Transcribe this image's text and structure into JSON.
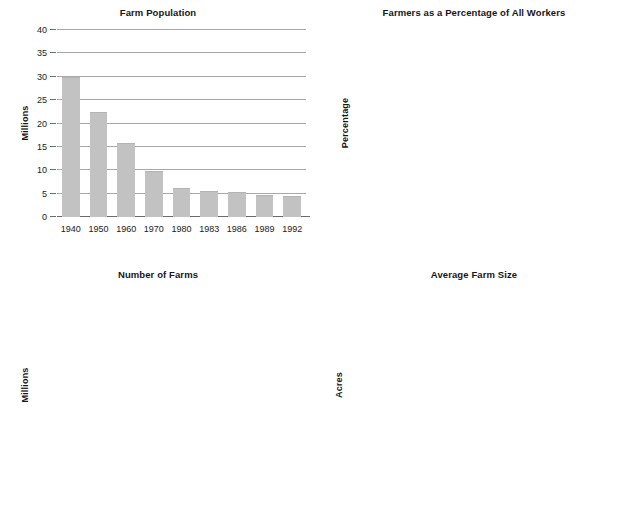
{
  "page": {
    "background": "#ffffff",
    "bar_color": "#c2c2c2",
    "grid_color": "#a8a8a8",
    "axis_color": "#6b6b6b",
    "text_color": "#1a1a1a"
  },
  "chart_data": [
    {
      "type": "bar",
      "title": "Farm Population",
      "xlabel": "",
      "ylabel": "Millions",
      "categories": [
        "1940",
        "1950",
        "1960",
        "1970",
        "1980",
        "1983",
        "1986",
        "1989",
        "1992"
      ],
      "values": [
        30.0,
        22.4,
        15.9,
        9.9,
        6.2,
        5.6,
        5.4,
        4.8,
        4.6
      ],
      "ylim": [
        0,
        40
      ],
      "yticks": [
        0,
        5,
        10,
        15,
        20,
        25,
        30,
        35,
        40
      ],
      "ytick_labels": [
        "0",
        "5",
        "10",
        "15",
        "20",
        "25",
        "30",
        "35",
        "40"
      ],
      "grid": true,
      "legend": "none"
    },
    {
      "type": "bar",
      "title": "Farmers as a Percentage of All Workers",
      "xlabel": "",
      "ylabel": "Percentage",
      "categories": [
        "1940",
        "1950",
        "1960",
        "1970",
        "1980",
        "1990",
        "1992"
      ],
      "values": [
        17.4,
        11.2,
        6.5,
        3.8,
        2.7,
        2.4,
        2.5
      ],
      "ylim": [
        0,
        20
      ],
      "yticks": [
        0,
        4,
        8,
        12,
        16,
        20
      ],
      "ytick_labels": [
        "0",
        "4",
        "8",
        "12",
        "16",
        "20"
      ],
      "grid": true,
      "legend": "none"
    },
    {
      "type": "bar",
      "title": "Number of Farms",
      "xlabel": "",
      "ylabel": "Millions",
      "categories": [
        "1940",
        "1950",
        "1960",
        "1970",
        "1980",
        "1983",
        "1986",
        "1989",
        "1993"
      ],
      "values": [
        6.0,
        5.25,
        3.95,
        2.9,
        2.35,
        2.25,
        2.15,
        2.05,
        2.05
      ],
      "ylim": [
        0,
        7
      ],
      "yticks": [
        0,
        1,
        2,
        3,
        4,
        5,
        6,
        7
      ],
      "ytick_labels": [
        "0",
        "1",
        "2",
        "3",
        "4",
        "5",
        "6",
        "7"
      ],
      "grid": true,
      "legend": "none"
    },
    {
      "type": "bar",
      "title": "Average Farm Size",
      "xlabel": "",
      "ylabel": "Acres",
      "categories": [
        "1940",
        "1950",
        "1960",
        "1970",
        "1980",
        "1983",
        "1986",
        "1989",
        "1993"
      ],
      "values": [
        175,
        216,
        299,
        374,
        427,
        435,
        455,
        455,
        473
      ],
      "ylim": [
        0,
        500
      ],
      "yticks": [
        0,
        100,
        200,
        300,
        400,
        500
      ],
      "ytick_labels": [
        "0",
        "100",
        "200",
        "300",
        "400",
        "500"
      ],
      "grid": true,
      "legend": "none"
    }
  ]
}
